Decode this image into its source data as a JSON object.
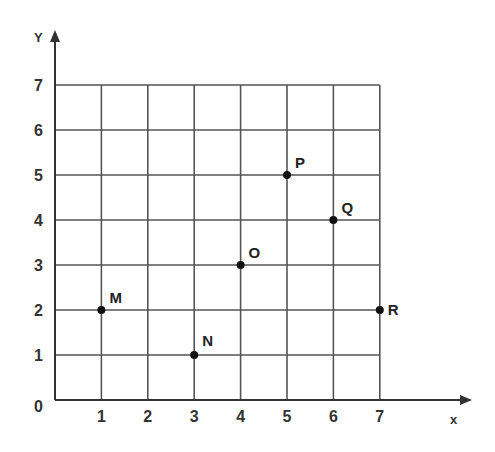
{
  "chart_data": {
    "type": "scatter",
    "title": "",
    "xlabel": "x",
    "ylabel": "Y",
    "xlim": [
      0,
      7
    ],
    "ylim": [
      0,
      7
    ],
    "grid": true,
    "x_ticks": [
      "1",
      "2",
      "3",
      "4",
      "5",
      "6",
      "7"
    ],
    "y_ticks": [
      "0",
      "1",
      "2",
      "3",
      "4",
      "5",
      "6",
      "7"
    ],
    "points": [
      {
        "label": "M",
        "x": 1,
        "y": 2
      },
      {
        "label": "N",
        "x": 3,
        "y": 1
      },
      {
        "label": "O",
        "x": 4,
        "y": 3
      },
      {
        "label": "P",
        "x": 5,
        "y": 5
      },
      {
        "label": "Q",
        "x": 6,
        "y": 4
      },
      {
        "label": "R",
        "x": 7,
        "y": 2
      }
    ]
  },
  "axes": {
    "x_label": "x",
    "y_label": "Y",
    "origin_label": "0"
  },
  "colors": {
    "grid": "#555555",
    "axis": "#333333",
    "point": "#111111",
    "background": "#ffffff"
  }
}
